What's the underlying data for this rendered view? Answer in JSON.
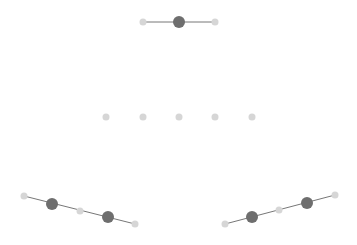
{
  "colors": {
    "background": "#ffffff",
    "line": "#777777",
    "dot_dark": "#6e6e6e",
    "dot_light": "#d6d6d6"
  },
  "groups": [
    {
      "name": "top-group",
      "line": true,
      "dots": [
        {
          "x": 143,
          "y": 22,
          "r": 3.5,
          "tone": "light"
        },
        {
          "x": 179,
          "y": 22,
          "r": 6,
          "tone": "dark"
        },
        {
          "x": 215,
          "y": 22,
          "r": 3.5,
          "tone": "light"
        }
      ]
    },
    {
      "name": "middle-row",
      "line": false,
      "dots": [
        {
          "x": 106,
          "y": 117,
          "r": 3.5,
          "tone": "light"
        },
        {
          "x": 143,
          "y": 117,
          "r": 3.5,
          "tone": "light"
        },
        {
          "x": 179,
          "y": 117,
          "r": 3.5,
          "tone": "light"
        },
        {
          "x": 215,
          "y": 117,
          "r": 3.5,
          "tone": "light"
        },
        {
          "x": 252,
          "y": 117,
          "r": 3.5,
          "tone": "light"
        }
      ]
    },
    {
      "name": "bottom-left-group",
      "line": true,
      "dots": [
        {
          "x": 24,
          "y": 196,
          "r": 3.5,
          "tone": "light"
        },
        {
          "x": 52,
          "y": 204,
          "r": 6,
          "tone": "dark"
        },
        {
          "x": 80,
          "y": 211,
          "r": 3.5,
          "tone": "light"
        },
        {
          "x": 108,
          "y": 217,
          "r": 6,
          "tone": "dark"
        },
        {
          "x": 135,
          "y": 224,
          "r": 3.5,
          "tone": "light"
        }
      ]
    },
    {
      "name": "bottom-right-group",
      "line": true,
      "dots": [
        {
          "x": 225,
          "y": 224,
          "r": 3.5,
          "tone": "light"
        },
        {
          "x": 252,
          "y": 217,
          "r": 6,
          "tone": "dark"
        },
        {
          "x": 279,
          "y": 210,
          "r": 3.5,
          "tone": "light"
        },
        {
          "x": 307,
          "y": 203,
          "r": 6,
          "tone": "dark"
        },
        {
          "x": 335,
          "y": 195,
          "r": 3.5,
          "tone": "light"
        }
      ]
    }
  ]
}
